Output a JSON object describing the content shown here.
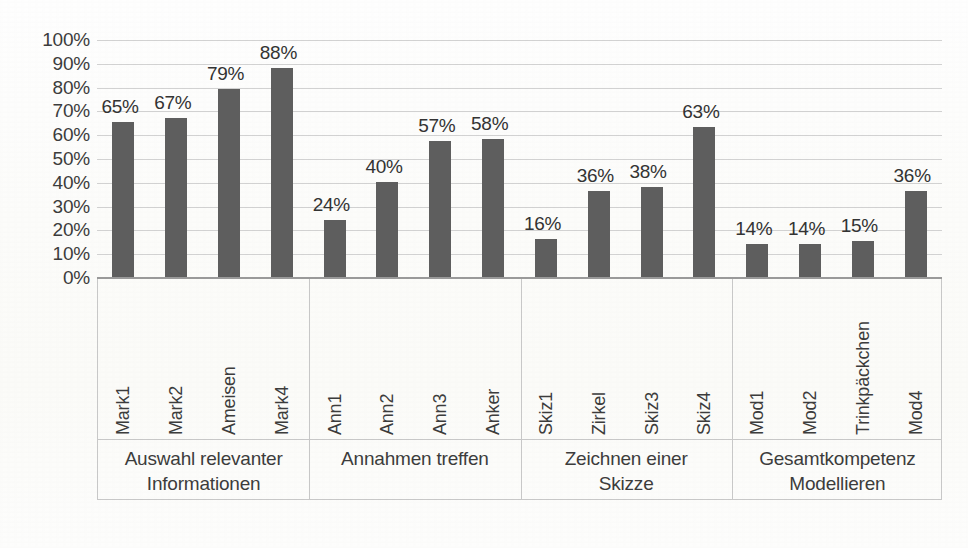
{
  "chart_data": {
    "type": "bar",
    "title": "",
    "subtitle": "",
    "xlabel": "",
    "ylabel": "",
    "ylim": [
      0,
      100
    ],
    "grid": true,
    "legend": "none",
    "value_suffix": "%",
    "y_ticks": [
      "0%",
      "10%",
      "20%",
      "30%",
      "40%",
      "50%",
      "60%",
      "70%",
      "80%",
      "90%",
      "100%"
    ],
    "y_tick_values": [
      0,
      10,
      20,
      30,
      40,
      50,
      60,
      70,
      80,
      90,
      100
    ],
    "categories": [
      "Mark1",
      "Mark2",
      "Ameisen",
      "Mark4",
      "Ann1",
      "Ann2",
      "Ann3",
      "Anker",
      "Skiz1",
      "Zirkel",
      "Skiz3",
      "Skiz4",
      "Mod1",
      "Mod2",
      "Trinkpäckchen",
      "Mod4"
    ],
    "values": [
      65,
      67,
      79,
      88,
      24,
      40,
      57,
      58,
      16,
      36,
      38,
      63,
      14,
      14,
      15,
      36
    ],
    "value_labels": [
      "65%",
      "67%",
      "79%",
      "88%",
      "24%",
      "40%",
      "57%",
      "58%",
      "16%",
      "36%",
      "38%",
      "63%",
      "14%",
      "14%",
      "15%",
      "36%"
    ],
    "groups": [
      {
        "label_line1": "Auswahl relevanter",
        "label_line2": "Informationen",
        "bar_indices": [
          0,
          1,
          2,
          3
        ]
      },
      {
        "label_line1": "Annahmen treffen",
        "label_line2": "",
        "bar_indices": [
          4,
          5,
          6,
          7
        ]
      },
      {
        "label_line1": "Zeichnen einer",
        "label_line2": "Skizze",
        "bar_indices": [
          8,
          9,
          10,
          11
        ]
      },
      {
        "label_line1": "Gesamtkompetenz",
        "label_line2": "Modellieren",
        "bar_indices": [
          12,
          13,
          14,
          15
        ]
      }
    ],
    "colors": {
      "bar": "#5e5e5e",
      "gridline": "#d2d2d2",
      "axis": "#9a9a9a",
      "text": "#3c3c3c",
      "background": "#fdfdfb"
    }
  }
}
